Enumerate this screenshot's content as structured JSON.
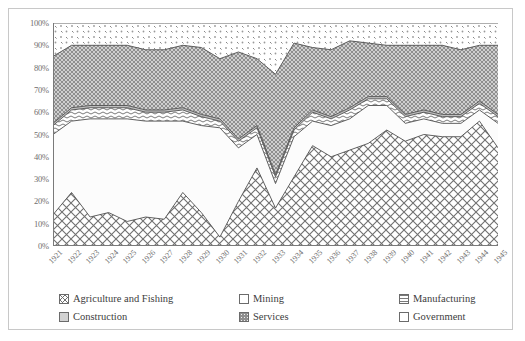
{
  "chart_data": {
    "type": "area",
    "stacked": "100-percent",
    "title": "",
    "xlabel": "",
    "ylabel": "",
    "ylim": [
      0,
      100
    ],
    "ytick_labels": [
      "0%",
      "10%",
      "20%",
      "30%",
      "40%",
      "50%",
      "60%",
      "70%",
      "80%",
      "90%",
      "100%"
    ],
    "ytick_values": [
      0,
      10,
      20,
      30,
      40,
      50,
      60,
      70,
      80,
      90,
      100
    ],
    "grid": false,
    "legend_position": "bottom",
    "categories": [
      "1921",
      "1922",
      "1923",
      "1924",
      "1925",
      "1926",
      "1927",
      "1928",
      "1929",
      "1930",
      "1931",
      "1932",
      "1933",
      "1934",
      "1935",
      "1936",
      "1937",
      "1938",
      "1939",
      "1940",
      "1941",
      "1942",
      "1943",
      "1944",
      "1945"
    ],
    "series": [
      {
        "name": "Agriculture and Fishing",
        "pattern": "diagonal-crosshatch",
        "values": [
          14,
          24,
          13,
          15,
          11,
          13,
          12,
          24,
          15,
          4,
          20,
          35,
          17,
          31,
          45,
          40,
          43,
          46,
          52,
          47,
          50,
          49,
          49,
          56,
          44
        ]
      },
      {
        "name": "Mining",
        "pattern": "solid-light",
        "values": [
          36,
          32,
          44,
          42,
          46,
          43,
          44,
          32,
          39,
          49,
          24,
          15,
          11,
          18,
          11,
          14,
          14,
          17,
          11,
          8,
          7,
          6,
          6,
          5,
          11
        ]
      },
      {
        "name": "Manufacturing",
        "pattern": "wavy-lines",
        "values": [
          4,
          5,
          5,
          5,
          5,
          4,
          4,
          5,
          4,
          3,
          3,
          3,
          3,
          3,
          4,
          3,
          4,
          3,
          3,
          3,
          3,
          3,
          3,
          3,
          3
        ]
      },
      {
        "name": "Construction",
        "pattern": "thin-dark-line",
        "values": [
          1,
          1,
          1,
          1,
          1,
          1,
          1,
          1,
          1,
          1,
          1,
          1,
          1,
          1,
          1,
          1,
          1,
          1,
          1,
          1,
          1,
          1,
          1,
          1,
          1
        ]
      },
      {
        "name": "Services",
        "pattern": "dense-dark-dots",
        "values": [
          30,
          28,
          27,
          27,
          27,
          27,
          27,
          28,
          30,
          27,
          39,
          30,
          45,
          38,
          28,
          30,
          30,
          24,
          23,
          31,
          29,
          31,
          29,
          25,
          31
        ]
      },
      {
        "name": "Government",
        "pattern": "sparse-dots",
        "values": [
          15,
          10,
          10,
          10,
          10,
          12,
          12,
          10,
          11,
          16,
          13,
          16,
          23,
          9,
          11,
          12,
          8,
          9,
          10,
          10,
          10,
          10,
          12,
          10,
          10
        ]
      }
    ],
    "legend_entries": [
      "Agriculture and Fishing",
      "Mining",
      "Manufacturing",
      "Construction",
      "Services",
      "Government"
    ]
  },
  "colors": {
    "axis": "#7a7a7a",
    "tick_text": "#6e6e6e",
    "legend_text": "#3d3d3d",
    "frame_border": "#c8c8c8",
    "series_outline": "#555555",
    "agriculture_fill": "#ffffff",
    "mining_fill": "#fbfbfb",
    "manufacturing_fill": "#ffffff",
    "construction_fill": "#d8d8d8",
    "services_fill": "#9a9a9a",
    "government_fill": "#ffffff"
  }
}
